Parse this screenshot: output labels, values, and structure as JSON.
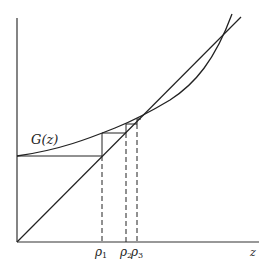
{
  "diagram": {
    "curve_label": "G(z)",
    "x_axis_label": "z",
    "iterate_labels": [
      {
        "symbol": "ρ",
        "sub": "1"
      },
      {
        "symbol": "ρ",
        "sub": "2"
      },
      {
        "symbol": "ρ",
        "sub": "3"
      }
    ],
    "colors": {
      "line": "#222222",
      "background": "#ffffff"
    }
  }
}
